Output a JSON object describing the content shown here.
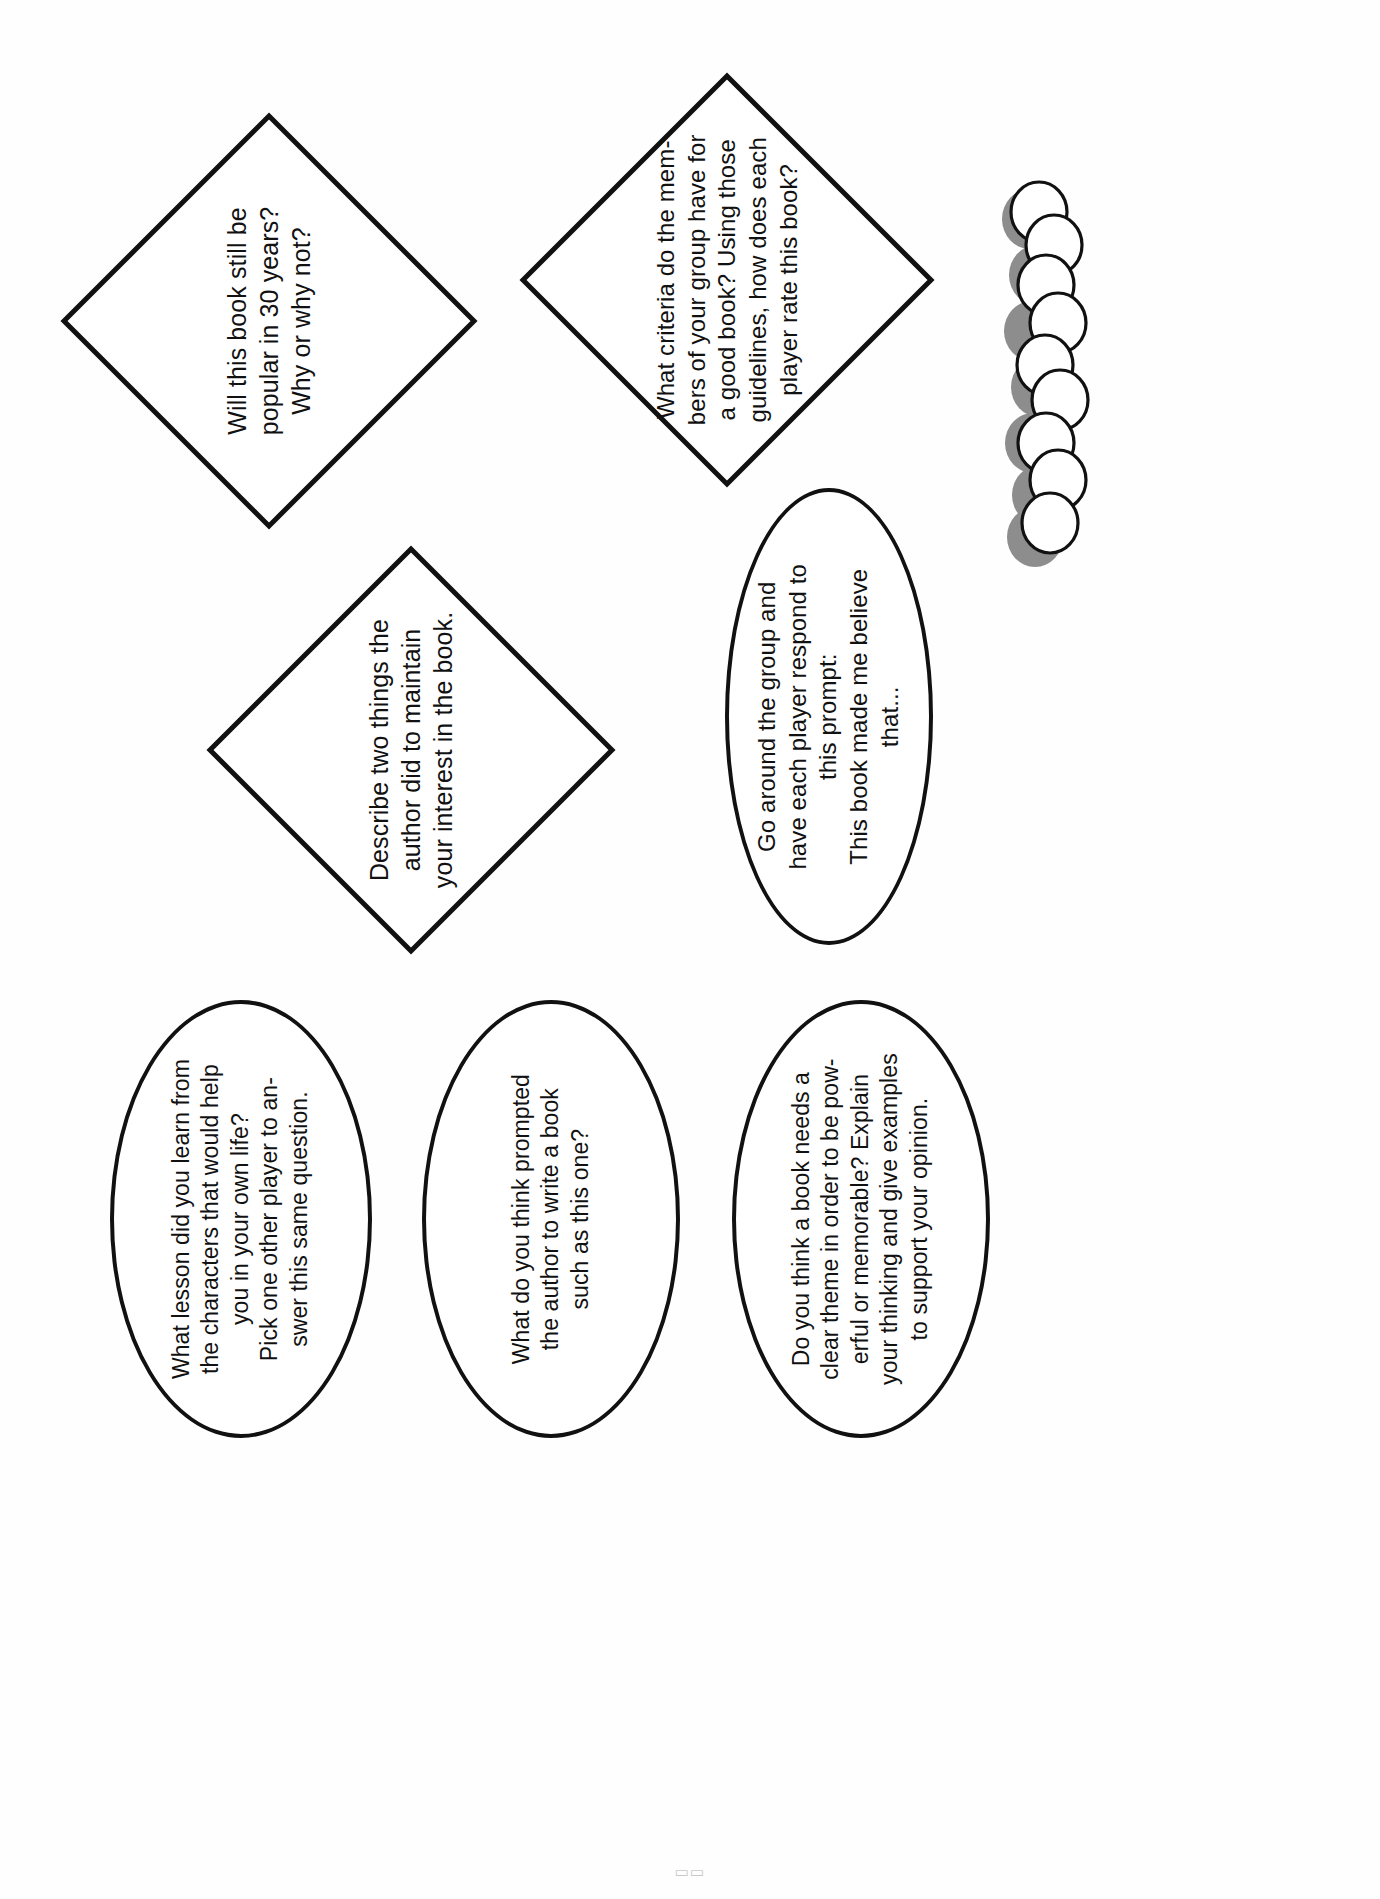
{
  "page": {
    "orientation": "landscape-rotated",
    "background_color": "#fefefe",
    "ink_color": "#111111",
    "page_number": "▭▭"
  },
  "shapes": [
    {
      "id": "diamond-popular-30-years",
      "type": "diamond",
      "text": "Will this book still be\npopular in 30 years?\nWhy or why not?"
    },
    {
      "id": "diamond-criteria-good-book",
      "type": "diamond",
      "text": "What criteria do the mem-\nbers of your group have for\na good book? Using those\nguidelines, how does each\nplayer rate this book?"
    },
    {
      "id": "diamond-maintain-interest",
      "type": "diamond",
      "text": "Describe two things the\nauthor did to maintain\nyour interest in the book."
    },
    {
      "id": "oval-made-me-believe",
      "type": "oval",
      "text": "Go around the group and\nhave each player respond to\nthis prompt:\nThis book made me believe\nthat..."
    },
    {
      "id": "oval-lesson-learned",
      "type": "oval",
      "text": "What lesson did you learn from\nthe characters that would help\nyou in your own life?\nPick one other player to an-\nswer this same question."
    },
    {
      "id": "oval-what-prompted-author",
      "type": "oval",
      "text": "What do you think prompted\nthe author to write a book\nsuch as this one?"
    },
    {
      "id": "oval-clear-theme",
      "type": "oval",
      "text": "Do you think a book needs a\nclear theme in order to be pow-\nerful or memorable? Explain\nyour thinking and give examples\nto support your opinion."
    }
  ],
  "decoration": {
    "circle_chain": {
      "name": "overlapping-circles-chain",
      "count": 7,
      "fill_color": "#ffffff",
      "outline_color": "#111111",
      "shadow_color": "#8d8d8d"
    }
  }
}
